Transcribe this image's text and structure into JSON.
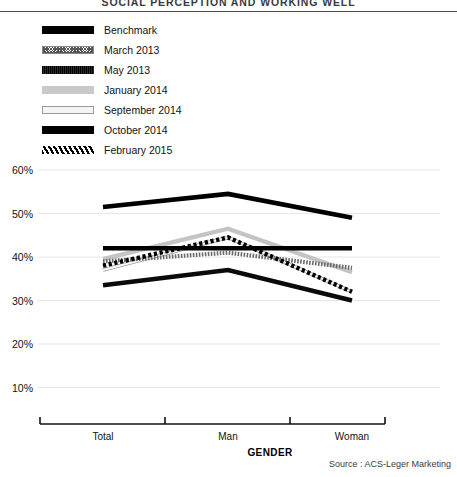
{
  "title": "SOCIAL PERCEPTION AND WORKING WELL",
  "source": "Source : ACS-Leger Marketing",
  "legend": {
    "items": [
      {
        "label": "Benchmark",
        "swatch": "sw-benchmark",
        "key": "benchmark"
      },
      {
        "label": "March 2013",
        "swatch": "sw-march2013",
        "key": "march2013"
      },
      {
        "label": "May 2013",
        "swatch": "sw-may2013",
        "key": "may2013"
      },
      {
        "label": "January 2014",
        "swatch": "sw-january2014",
        "key": "january2014"
      },
      {
        "label": "September 2014",
        "swatch": "sw-september2014",
        "key": "september2014"
      },
      {
        "label": "October 2014",
        "swatch": "sw-october2014",
        "key": "october2014"
      },
      {
        "label": "February 2015",
        "swatch": "sw-february2015",
        "key": "february2015"
      }
    ]
  },
  "axis": {
    "x_title": "GENDER",
    "y_ticks": [
      "60%",
      "50%",
      "40%",
      "30%",
      "20%",
      "10%"
    ],
    "x_ticks": [
      "Total",
      "Man",
      "Woman"
    ]
  },
  "chart_data": {
    "type": "line",
    "title": "SOCIAL PERCEPTION AND WORKING WELL",
    "xlabel": "GENDER",
    "ylabel": "",
    "categories": [
      "Total",
      "Man",
      "Woman"
    ],
    "ylim": [
      0,
      60
    ],
    "yticks": [
      10,
      20,
      30,
      40,
      50,
      60
    ],
    "ytick_labels": [
      "10%",
      "20%",
      "30%",
      "40%",
      "50%",
      "60%"
    ],
    "grid": true,
    "legend_position": "top-left",
    "series": [
      {
        "name": "Benchmark",
        "values": [
          42,
          42,
          42
        ]
      },
      {
        "name": "March 2013",
        "values": [
          39,
          41,
          37.5
        ]
      },
      {
        "name": "May 2013",
        "values": [
          33.5,
          37,
          30
        ]
      },
      {
        "name": "January 2014",
        "values": [
          39.5,
          46.5,
          36.5
        ]
      },
      {
        "name": "September 2014",
        "values": [
          37,
          44.5,
          32
        ]
      },
      {
        "name": "October 2014",
        "values": [
          51.5,
          54.5,
          49
        ]
      },
      {
        "name": "February 2015",
        "values": [
          38,
          44.5,
          32
        ]
      }
    ]
  }
}
